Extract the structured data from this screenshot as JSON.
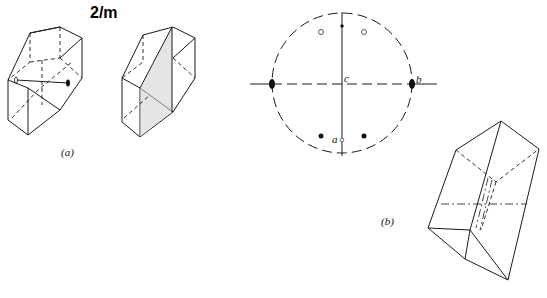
{
  "title": "2/m",
  "panel_a": {
    "label": "(a)",
    "crystal_left": "prism with 2-fold axis",
    "crystal_right": "prism with mirror plane"
  },
  "panel_b": {
    "label": "(b)",
    "stereogram": {
      "axis_labels": {
        "a": "a",
        "b": "b",
        "c": "c"
      },
      "open_circles": 2,
      "filled_dots": 2
    },
    "crystal": "oblique prism with mirror plane"
  },
  "colors": {
    "line": "#1a1a1a",
    "background": "#ffffff"
  }
}
